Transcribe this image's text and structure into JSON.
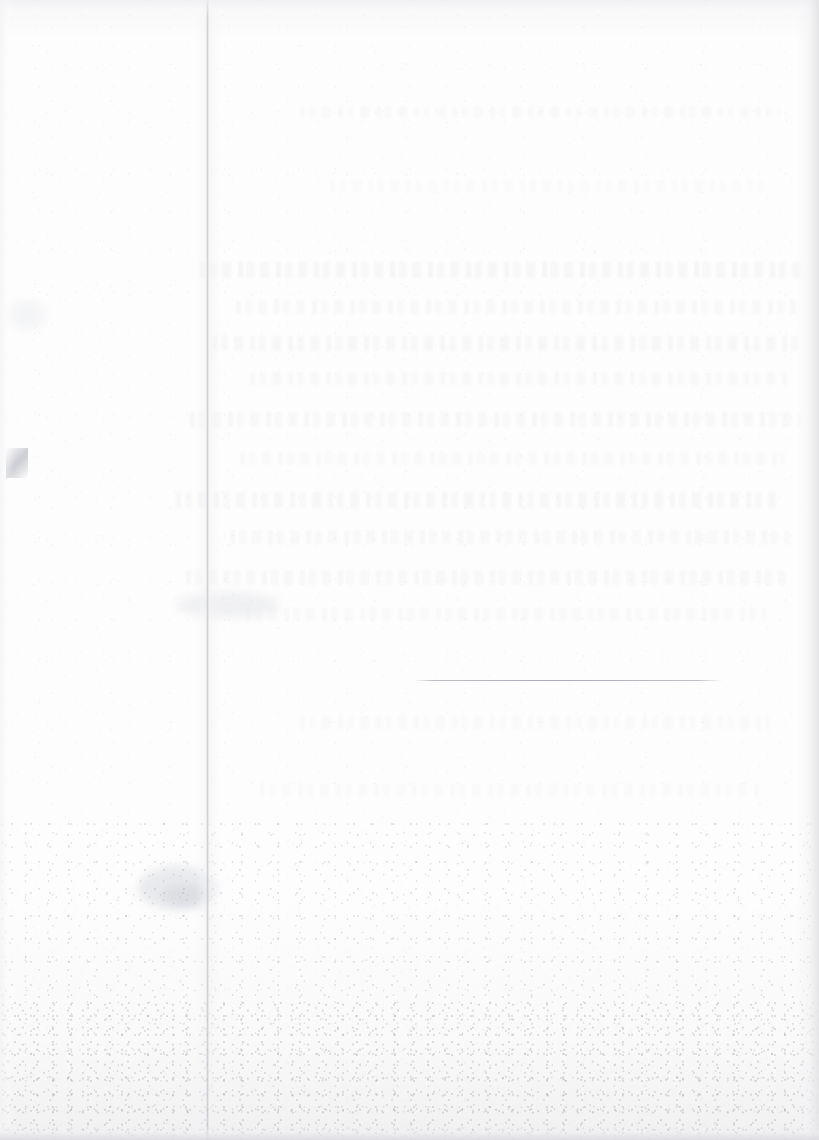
{
  "document": {
    "kind": "scanned-page",
    "description": "Blank scanned page",
    "text_content": "",
    "visible_text": []
  },
  "canvas": {
    "width": 819,
    "height": 1140,
    "paper_color": "#fdfdfd",
    "background_color": "#ffffff"
  },
  "marks": {
    "vertical_fold": {
      "name": "vertical-crease",
      "x": 207,
      "y": 0,
      "height": 1140,
      "color": "#acaeb6"
    },
    "horizontal_rule": {
      "name": "horizontal-rule",
      "x": 414,
      "y": 680,
      "width": 309,
      "color": "#9ea0a9"
    },
    "smudges": [
      {
        "name": "smudge-lower-left",
        "x": 138,
        "y": 866,
        "width": 78,
        "height": 44,
        "color": "#e3e4e8",
        "opacity": 0.75
      },
      {
        "name": "smudge-lower-left-2",
        "x": 162,
        "y": 884,
        "width": 46,
        "height": 22,
        "color": "#d7d9de",
        "opacity": 0.7
      },
      {
        "name": "smudge-mid-left",
        "x": 176,
        "y": 592,
        "width": 104,
        "height": 26,
        "color": "#e8e9ec",
        "opacity": 0.6
      },
      {
        "name": "smudge-upper-left",
        "x": 8,
        "y": 300,
        "width": 38,
        "height": 30,
        "color": "#eeeff2",
        "opacity": 0.55
      }
    ],
    "scratch": {
      "name": "scratch-left-edge",
      "x": 6,
      "y": 448,
      "width": 22,
      "height": 30
    },
    "ghost_bands": [
      {
        "name": "ghost-band-1",
        "x": 200,
        "y": 262,
        "width": 600,
        "height": 16,
        "opacity": 0.32
      },
      {
        "name": "ghost-band-2",
        "x": 236,
        "y": 300,
        "width": 560,
        "height": 14,
        "opacity": 0.26
      },
      {
        "name": "ghost-band-3",
        "x": 212,
        "y": 336,
        "width": 590,
        "height": 15,
        "opacity": 0.3
      },
      {
        "name": "ghost-band-4",
        "x": 250,
        "y": 372,
        "width": 540,
        "height": 13,
        "opacity": 0.24
      },
      {
        "name": "ghost-band-5",
        "x": 190,
        "y": 412,
        "width": 610,
        "height": 15,
        "opacity": 0.28
      },
      {
        "name": "ghost-band-6",
        "x": 240,
        "y": 452,
        "width": 545,
        "height": 13,
        "opacity": 0.22
      },
      {
        "name": "ghost-band-7",
        "x": 176,
        "y": 492,
        "width": 600,
        "height": 16,
        "opacity": 0.3
      },
      {
        "name": "ghost-band-8",
        "x": 230,
        "y": 530,
        "width": 560,
        "height": 14,
        "opacity": 0.25
      },
      {
        "name": "ghost-band-9",
        "x": 186,
        "y": 570,
        "width": 600,
        "height": 15,
        "opacity": 0.27
      },
      {
        "name": "ghost-band-10",
        "x": 246,
        "y": 608,
        "width": 520,
        "height": 13,
        "opacity": 0.21
      },
      {
        "name": "ghost-band-11",
        "x": 300,
        "y": 106,
        "width": 480,
        "height": 12,
        "opacity": 0.18
      },
      {
        "name": "ghost-band-12",
        "x": 330,
        "y": 180,
        "width": 440,
        "height": 12,
        "opacity": 0.16
      },
      {
        "name": "ghost-band-13",
        "x": 300,
        "y": 716,
        "width": 470,
        "height": 13,
        "opacity": 0.18
      },
      {
        "name": "ghost-band-14",
        "x": 260,
        "y": 784,
        "width": 500,
        "height": 13,
        "opacity": 0.17
      }
    ]
  }
}
